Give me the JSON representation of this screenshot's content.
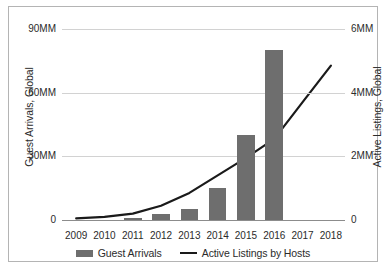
{
  "chart_data": {
    "type": "bar",
    "title": "",
    "xlabel": "",
    "ylabel": "Guest Arrivals, Global",
    "y2label": "Active Listings, Global",
    "categories": [
      "2009",
      "2010",
      "2011",
      "2012",
      "2013",
      "2014",
      "2015",
      "2016",
      "2017",
      "2018"
    ],
    "ylim": [
      0,
      90
    ],
    "y2lim": [
      0,
      6
    ],
    "y_ticks": [
      "0",
      "30MM",
      "60MM",
      "90MM"
    ],
    "y_tick_values": [
      0,
      30,
      60,
      90
    ],
    "y2_ticks": [
      "0",
      "2MM",
      "4MM",
      "6MM"
    ],
    "y2_tick_values": [
      0,
      2,
      4,
      6
    ],
    "grid": true,
    "legend_position": "bottom",
    "series": [
      {
        "name": "Guest Arrivals",
        "kind": "bar",
        "axis": "left",
        "unit": "MM",
        "color": "#6e6e6e",
        "values": [
          0,
          0,
          1,
          3,
          5,
          15,
          40,
          80,
          null,
          null
        ]
      },
      {
        "name": "Active Listings by Hosts",
        "kind": "line",
        "axis": "right",
        "unit": "MM",
        "color": "#1a1a1a",
        "values": [
          0.05,
          0.1,
          0.2,
          0.45,
          0.85,
          1.4,
          1.95,
          2.55,
          3.7,
          4.85
        ]
      }
    ]
  },
  "axes": {
    "left_title": "Guest Arrivals, Global",
    "right_title": "Active Listings, Global",
    "left_ticks": [
      {
        "label": "90MM",
        "value": 90
      },
      {
        "label": "60MM",
        "value": 60
      },
      {
        "label": "30MM",
        "value": 30
      },
      {
        "label": "0",
        "value": 0
      }
    ],
    "right_ticks": [
      {
        "label": "6MM",
        "value": 6
      },
      {
        "label": "4MM",
        "value": 4
      },
      {
        "label": "2MM",
        "value": 2
      },
      {
        "label": "0",
        "value": 0
      }
    ],
    "x_ticks": [
      "2009",
      "2010",
      "2011",
      "2012",
      "2013",
      "2014",
      "2015",
      "2016",
      "2017",
      "2018"
    ]
  },
  "legend": {
    "items": [
      {
        "label": "Guest Arrivals",
        "marker": "bar-swatch-icon",
        "color": "#6e6e6e"
      },
      {
        "label": "Active Listings by Hosts",
        "marker": "line-swatch-icon",
        "color": "#1a1a1a"
      }
    ]
  },
  "colors": {
    "bar": "#6e6e6e",
    "line": "#1a1a1a",
    "grid": "#d2d2d2",
    "axis": "#8c8c8c",
    "frame": "#b4b4b4",
    "text": "#2b2b2b",
    "background": "#ffffff"
  }
}
